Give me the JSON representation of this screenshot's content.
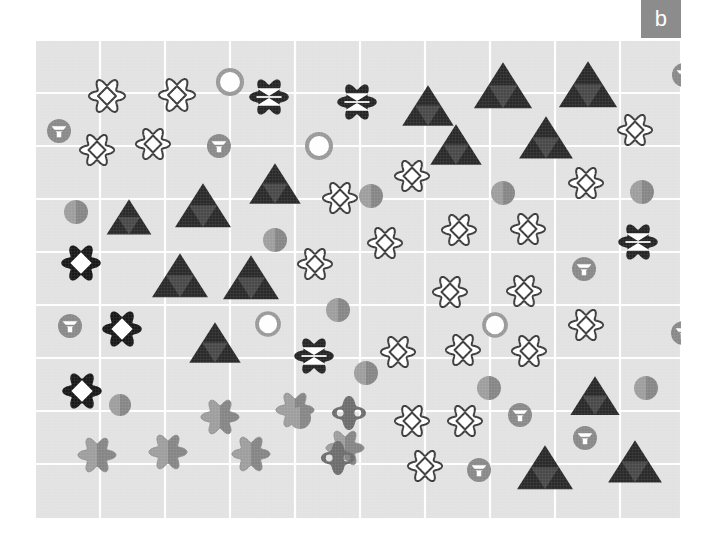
{
  "figure": {
    "panel_label": "b",
    "background_color": "#ffffff",
    "plot_background_color": "#e3e3e3",
    "grid_color": "#ffffff",
    "panel_label_bg": "#8c8c8c",
    "panel_label_fg": "#ffffff"
  },
  "chart_data": {
    "type": "scatter",
    "title": "",
    "subtitle": "",
    "xlabel": "",
    "ylabel": "",
    "xlim": [
      0,
      646
    ],
    "ylim": [
      0,
      479
    ],
    "grid": true,
    "grid_x": [
      0,
      65,
      130,
      195,
      260,
      325,
      390,
      455,
      520,
      585,
      646
    ],
    "grid_y": [
      0,
      53,
      106,
      159,
      212,
      265,
      318,
      371,
      424,
      479
    ],
    "legend": [],
    "tick_labels_x": [],
    "tick_labels_y": [],
    "annotations": [],
    "marker_types": [
      {
        "name": "flower-diamond-outline",
        "description": "white scalloped flower outline with inner diamond outline",
        "fill": "#ffffff",
        "stroke": "#3d3d3d"
      },
      {
        "name": "flower-hourglass-dark",
        "description": "black scalloped flower with white hourglass (two opposing triangles)",
        "fill": "#262626",
        "stroke": "#262626"
      },
      {
        "name": "flower-diamond-dark",
        "description": "black scalloped flower with white diamond cutout",
        "fill": "#1a1a1a",
        "stroke": "#1a1a1a"
      },
      {
        "name": "flower-gray",
        "description": "solid two-tone gray scalloped flower",
        "fill": "#9a9a9a",
        "stroke": "#828282"
      },
      {
        "name": "triangle-dark",
        "description": "dark triangle with lighter inverted inner triangle",
        "fill": "#2b2b2b",
        "stroke": "#2b2b2b"
      },
      {
        "name": "circle-ring",
        "description": "gray ring with white fill",
        "fill": "#ffffff",
        "stroke": "#9a9a9a"
      },
      {
        "name": "circle-gray",
        "description": "solid two-tone gray circle",
        "fill": "#9a9a9a",
        "stroke": "#828282"
      },
      {
        "name": "circle-funnel",
        "description": "gray circle with white funnel / inverted triangle cutout",
        "fill": "#8a8a8a",
        "stroke": "#8a8a8a"
      },
      {
        "name": "diamond-lens",
        "description": "gray four-lobed diamond with white circle cutouts",
        "fill": "#6e6e6e",
        "stroke": "#6e6e6e"
      }
    ],
    "points": [
      {
        "x": 72,
        "y": 56,
        "type": "flower-diamond-outline",
        "size": 36
      },
      {
        "x": 142,
        "y": 55,
        "type": "flower-diamond-outline",
        "size": 36
      },
      {
        "x": 62,
        "y": 110,
        "type": "flower-diamond-outline",
        "size": 34
      },
      {
        "x": 118,
        "y": 104,
        "type": "flower-diamond-outline",
        "size": 34
      },
      {
        "x": 305,
        "y": 158,
        "type": "flower-diamond-outline",
        "size": 34
      },
      {
        "x": 377,
        "y": 136,
        "type": "flower-diamond-outline",
        "size": 34
      },
      {
        "x": 280,
        "y": 224,
        "type": "flower-diamond-outline",
        "size": 34
      },
      {
        "x": 350,
        "y": 203,
        "type": "flower-diamond-outline",
        "size": 34
      },
      {
        "x": 424,
        "y": 190,
        "type": "flower-diamond-outline",
        "size": 34
      },
      {
        "x": 493,
        "y": 189,
        "type": "flower-diamond-outline",
        "size": 34
      },
      {
        "x": 415,
        "y": 252,
        "type": "flower-diamond-outline",
        "size": 34
      },
      {
        "x": 489,
        "y": 251,
        "type": "flower-diamond-outline",
        "size": 34
      },
      {
        "x": 551,
        "y": 143,
        "type": "flower-diamond-outline",
        "size": 34
      },
      {
        "x": 600,
        "y": 90,
        "type": "flower-diamond-outline",
        "size": 34
      },
      {
        "x": 551,
        "y": 285,
        "type": "flower-diamond-outline",
        "size": 34
      },
      {
        "x": 363,
        "y": 312,
        "type": "flower-diamond-outline",
        "size": 34
      },
      {
        "x": 428,
        "y": 310,
        "type": "flower-diamond-outline",
        "size": 34
      },
      {
        "x": 494,
        "y": 311,
        "type": "flower-diamond-outline",
        "size": 34
      },
      {
        "x": 377,
        "y": 381,
        "type": "flower-diamond-outline",
        "size": 34
      },
      {
        "x": 430,
        "y": 381,
        "type": "flower-diamond-outline",
        "size": 34
      },
      {
        "x": 390,
        "y": 426,
        "type": "flower-diamond-outline",
        "size": 34
      },
      {
        "x": 234,
        "y": 57,
        "type": "flower-hourglass-dark",
        "size": 38
      },
      {
        "x": 322,
        "y": 62,
        "type": "flower-hourglass-dark",
        "size": 38
      },
      {
        "x": 603,
        "y": 202,
        "type": "flower-hourglass-dark",
        "size": 38
      },
      {
        "x": 279,
        "y": 316,
        "type": "flower-hourglass-dark",
        "size": 38
      },
      {
        "x": 46,
        "y": 223,
        "type": "flower-diamond-dark",
        "size": 38
      },
      {
        "x": 87,
        "y": 289,
        "type": "flower-diamond-dark",
        "size": 38
      },
      {
        "x": 47,
        "y": 351,
        "type": "flower-diamond-dark",
        "size": 38
      },
      {
        "x": 62,
        "y": 415,
        "type": "flower-gray",
        "size": 38
      },
      {
        "x": 133,
        "y": 412,
        "type": "flower-gray",
        "size": 38
      },
      {
        "x": 185,
        "y": 377,
        "type": "flower-gray",
        "size": 38
      },
      {
        "x": 216,
        "y": 414,
        "type": "flower-gray",
        "size": 38
      },
      {
        "x": 260,
        "y": 370,
        "type": "flower-gray",
        "size": 38
      },
      {
        "x": 310,
        "y": 408,
        "type": "flower-gray",
        "size": 38
      },
      {
        "x": 240,
        "y": 146,
        "type": "triangle-dark",
        "size": 46
      },
      {
        "x": 94,
        "y": 179,
        "type": "triangle-dark",
        "size": 40
      },
      {
        "x": 168,
        "y": 168,
        "type": "triangle-dark",
        "size": 50
      },
      {
        "x": 145,
        "y": 238,
        "type": "triangle-dark",
        "size": 50
      },
      {
        "x": 216,
        "y": 240,
        "type": "triangle-dark",
        "size": 50
      },
      {
        "x": 180,
        "y": 305,
        "type": "triangle-dark",
        "size": 46
      },
      {
        "x": 393,
        "y": 68,
        "type": "triangle-dark",
        "size": 46
      },
      {
        "x": 468,
        "y": 48,
        "type": "triangle-dark",
        "size": 52
      },
      {
        "x": 553,
        "y": 47,
        "type": "triangle-dark",
        "size": 52
      },
      {
        "x": 421,
        "y": 107,
        "type": "triangle-dark",
        "size": 46
      },
      {
        "x": 511,
        "y": 100,
        "type": "triangle-dark",
        "size": 48
      },
      {
        "x": 560,
        "y": 358,
        "type": "triangle-dark",
        "size": 44
      },
      {
        "x": 510,
        "y": 430,
        "type": "triangle-dark",
        "size": 50
      },
      {
        "x": 600,
        "y": 424,
        "type": "triangle-dark",
        "size": 48
      },
      {
        "x": 195,
        "y": 42,
        "type": "circle-ring",
        "size": 24
      },
      {
        "x": 284,
        "y": 106,
        "type": "circle-ring",
        "size": 24
      },
      {
        "x": 233,
        "y": 284,
        "type": "circle-ring",
        "size": 22
      },
      {
        "x": 460,
        "y": 285,
        "type": "circle-ring",
        "size": 22
      },
      {
        "x": 41,
        "y": 172,
        "type": "circle-gray",
        "size": 24
      },
      {
        "x": 240,
        "y": 200,
        "type": "circle-gray",
        "size": 24
      },
      {
        "x": 336,
        "y": 156,
        "type": "circle-gray",
        "size": 24
      },
      {
        "x": 468,
        "y": 153,
        "type": "circle-gray",
        "size": 24
      },
      {
        "x": 607,
        "y": 152,
        "type": "circle-gray",
        "size": 24
      },
      {
        "x": 303,
        "y": 270,
        "type": "circle-gray",
        "size": 24
      },
      {
        "x": 611,
        "y": 348,
        "type": "circle-gray",
        "size": 24
      },
      {
        "x": 454,
        "y": 348,
        "type": "circle-gray",
        "size": 24
      },
      {
        "x": 85,
        "y": 365,
        "type": "circle-gray",
        "size": 22
      },
      {
        "x": 265,
        "y": 378,
        "type": "circle-gray",
        "size": 22
      },
      {
        "x": 331,
        "y": 333,
        "type": "circle-gray",
        "size": 24
      },
      {
        "x": 24,
        "y": 91,
        "type": "circle-funnel",
        "size": 24
      },
      {
        "x": 184,
        "y": 106,
        "type": "circle-funnel",
        "size": 24
      },
      {
        "x": 649,
        "y": 35,
        "type": "circle-funnel",
        "size": 24
      },
      {
        "x": 549,
        "y": 229,
        "type": "circle-funnel",
        "size": 24
      },
      {
        "x": 35,
        "y": 286,
        "type": "circle-funnel",
        "size": 24
      },
      {
        "x": 648,
        "y": 293,
        "type": "circle-funnel",
        "size": 24
      },
      {
        "x": 485,
        "y": 375,
        "type": "circle-funnel",
        "size": 24
      },
      {
        "x": 550,
        "y": 398,
        "type": "circle-funnel",
        "size": 24
      },
      {
        "x": 444,
        "y": 430,
        "type": "circle-funnel",
        "size": 24
      },
      {
        "x": 314,
        "y": 373,
        "type": "diamond-lens",
        "size": 34
      },
      {
        "x": 303,
        "y": 418,
        "type": "diamond-lens",
        "size": 34
      }
    ]
  }
}
